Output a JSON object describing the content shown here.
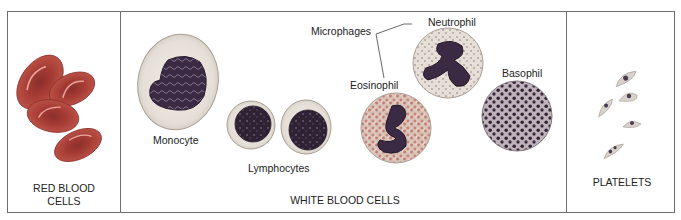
{
  "figure": {
    "panels": [
      {
        "id": "red",
        "label_line1": "RED BLOOD",
        "label_line2": "CELLS"
      },
      {
        "id": "white",
        "label": "WHITE BLOOD CELLS"
      },
      {
        "id": "platelets",
        "label": "PLATELETS"
      }
    ],
    "cell_labels": {
      "monocyte": "Monocyte",
      "lymphocytes": "Lymphocytes",
      "eosinophil": "Eosinophil",
      "neutrophil": "Neutrophil",
      "basophil": "Basophil",
      "microphages": "Microphages"
    },
    "colors": {
      "frame": "#6e6e6e",
      "rbc": "#b84a40",
      "rbc_dark": "#8a2f2a",
      "nucleus": "#3a2a44",
      "granule_eos": "#c98478",
      "granule_neu": "#8e6f8a",
      "granule_baso": "#2f2338",
      "cytoplasm": "#ece8e2"
    }
  }
}
